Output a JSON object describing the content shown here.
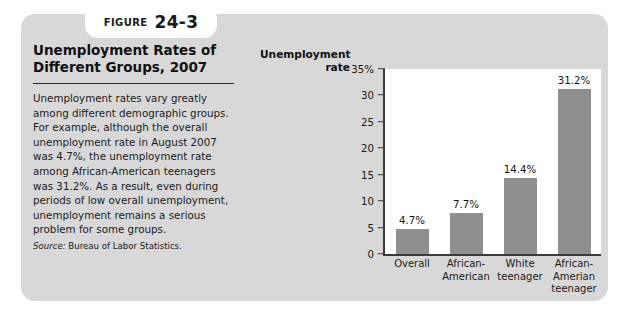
{
  "figure": {
    "label_word": "FIGURE",
    "number": "24-3",
    "title": "Unemployment Rates of Different Groups, 2007",
    "body": "Unemployment rates vary greatly among different demographic groups. For example, although the overall unemployment rate in August 2007 was 4.7%, the unemployment rate among African-American teenagers was 31.2%. As a result, even during periods of low overall unemployment, unemployment remains a serious problem for some groups.",
    "source_label": "Source:",
    "source_text": "Bureau of Labor Statistics."
  },
  "chart_data": {
    "type": "bar",
    "title": "Unemployment Rates of Different Groups, 2007",
    "ylabel": "Unemployment rate",
    "xlabel": "",
    "categories": [
      "Overall",
      "African-\nAmerican",
      "White\nteenager",
      "African-\nAmerian\nteenager"
    ],
    "values": [
      4.7,
      7.7,
      14.4,
      31.2
    ],
    "data_labels": [
      "4.7%",
      "7.7%",
      "14.4%",
      "31.2%"
    ],
    "ylim": [
      0,
      35
    ],
    "ytick_labels": [
      "35%",
      "30",
      "25",
      "20",
      "15",
      "10",
      "5",
      "0"
    ],
    "ytick_values": [
      35,
      30,
      25,
      20,
      15,
      10,
      5,
      0
    ],
    "grid": false,
    "legend": false,
    "bar_color": "#8f8f8f",
    "plot_background": "#ffffff",
    "axis_color": "#3a3a3a"
  },
  "style": {
    "panel_background": "#d8d8d8",
    "page_background": "#ffffff",
    "text_color": "#1a1a1a"
  }
}
